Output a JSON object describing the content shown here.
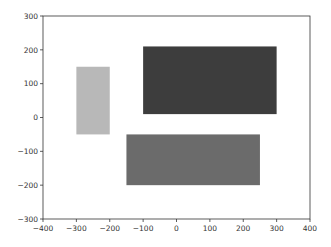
{
  "chart_data": {
    "type": "rectangles",
    "title": "",
    "xlabel": "",
    "ylabel": "",
    "xlim": [
      -400,
      400
    ],
    "ylim": [
      -300,
      300
    ],
    "grid": false,
    "legend": null,
    "x_ticks": [
      -400,
      -300,
      -200,
      -100,
      0,
      100,
      200,
      300,
      400
    ],
    "y_ticks": [
      -300,
      -200,
      -100,
      0,
      100,
      200,
      300
    ],
    "x_tick_labels": [
      "−400",
      "−300",
      "−200",
      "−100",
      "0",
      "100",
      "200",
      "300",
      "400"
    ],
    "y_tick_labels": [
      "−300",
      "−200",
      "−100",
      "0",
      "100",
      "200",
      "300"
    ],
    "rectangles": [
      {
        "name": "light-rect",
        "x": -300,
        "y": -50,
        "width": 100,
        "height": 200,
        "color": "#b8b8b8"
      },
      {
        "name": "dark-rect",
        "x": -100,
        "y": 10,
        "width": 400,
        "height": 200,
        "color": "#3d3d3d"
      },
      {
        "name": "medium-rect",
        "x": -150,
        "y": -200,
        "width": 400,
        "height": 150,
        "color": "#6b6b6b"
      }
    ]
  }
}
